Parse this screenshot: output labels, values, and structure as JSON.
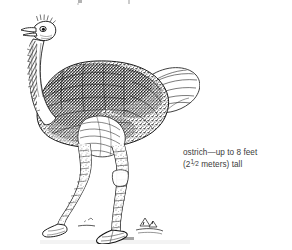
{
  "page": {
    "width": 292,
    "height": 250,
    "background_color": "#ffffff",
    "ink_color": "#1a1a1a",
    "caption_color": "#3b3b3b"
  },
  "illustration": {
    "name": "ostrich-line-drawing",
    "subject": "ostrich",
    "style": "pen-and-ink stipple engraving",
    "description": "Side view of an adult ostrich standing, facing left, with long bare neck, small head with open beak, dense dark stippled body plumage, pale wing and tail plumes, and two long bare legs with two-toed feet on a sparse ground line.",
    "parts": [
      "head",
      "beak",
      "eye",
      "neck",
      "body",
      "wing-plume",
      "tail-plume",
      "left-leg",
      "right-leg",
      "foot",
      "ground-marks"
    ]
  },
  "caption": {
    "name": "ostrich-caption",
    "line1": "ostrich—up to 8 feet",
    "line2_prefix": "(2",
    "line2_fraction_numerator": "1",
    "line2_fraction_denominator": "2",
    "line2_suffix": " meters) tall",
    "full_text": "ostrich—up to 8 feet (2½ meters) tall",
    "height_feet": "8",
    "height_meters": "2½"
  },
  "artifacts": {
    "top_edge_note": "faint cropped ink marks along the top trim edge",
    "bottom_edge_note": "faint grey smudge along the bottom trim edge"
  }
}
